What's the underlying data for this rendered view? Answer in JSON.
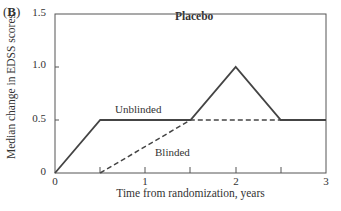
{
  "panel_label": "B",
  "chart_data": {
    "type": "line",
    "title": "Placebo",
    "xlabel": "Time from randomization, years",
    "ylabel": "Median change in EDSS scores",
    "xlim": [
      0,
      3
    ],
    "ylim": [
      0,
      1.5
    ],
    "x_ticks": [
      "0",
      "1",
      "2",
      "3"
    ],
    "x_minor_ticks": [
      0.5,
      1.5,
      2.5
    ],
    "y_ticks": [
      "0",
      "0.5",
      "1.0",
      "1.5"
    ],
    "grid": false,
    "legend": "inline labels",
    "series": [
      {
        "name": "Unblinded",
        "style": "solid",
        "x": [
          0,
          0.5,
          1.5,
          2,
          2.5,
          3
        ],
        "values": [
          0,
          0.5,
          0.5,
          1.0,
          0.5,
          0.5
        ]
      },
      {
        "name": "Blinded",
        "style": "dashed",
        "x": [
          0.5,
          1.5,
          3
        ],
        "values": [
          0,
          0.5,
          0.5
        ]
      }
    ]
  }
}
